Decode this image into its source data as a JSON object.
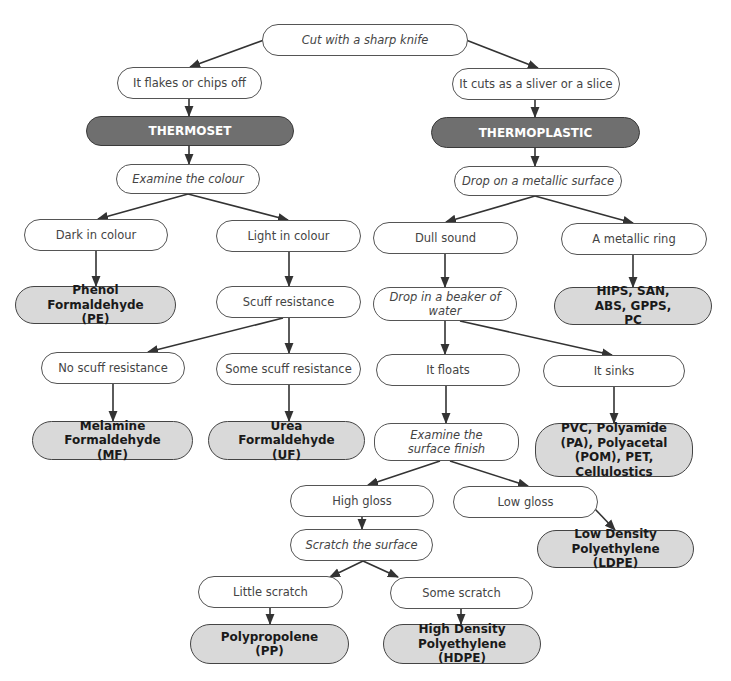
{
  "diagram": {
    "type": "decision-flowchart",
    "colors": {
      "category_fill": "#6f6f6f",
      "result_fill": "#d9d9d9",
      "node_border": "#555555",
      "edge": "#333333"
    },
    "nodes": {
      "cut": {
        "label": "Cut with a sharp knife",
        "kind": "action"
      },
      "flakes": {
        "label": "It flakes or chips off",
        "kind": "observation"
      },
      "thermoset": {
        "label": "THERMOSET",
        "kind": "category"
      },
      "examine_colour": {
        "label": "Examine the colour",
        "kind": "action"
      },
      "dark": {
        "label": "Dark in colour",
        "kind": "observation"
      },
      "light": {
        "label": "Light in colour",
        "kind": "observation"
      },
      "pe": {
        "label": "Phenol Formaldehyde (PE)",
        "kind": "result"
      },
      "scuff": {
        "label": "Scuff resistance",
        "kind": "observation"
      },
      "no_scuff": {
        "label": "No scuff resistance",
        "kind": "observation"
      },
      "some_scuff": {
        "label": "Some scuff resistance",
        "kind": "observation"
      },
      "mf": {
        "label": "Melamine Formaldehyde (MF)",
        "kind": "result"
      },
      "uf": {
        "label": "Urea Formaldehyde (UF)",
        "kind": "result"
      },
      "sliver": {
        "label": "It cuts as a sliver or a slice",
        "kind": "observation"
      },
      "thermoplastic": {
        "label": "THERMOPLASTIC",
        "kind": "category"
      },
      "drop_metal": {
        "label": "Drop on a metallic surface",
        "kind": "action"
      },
      "dull": {
        "label": "Dull sound",
        "kind": "observation"
      },
      "ring": {
        "label": "A metallic ring",
        "kind": "observation"
      },
      "hips": {
        "label": "HIPS, SAN, ABS, GPPS, PC",
        "kind": "result"
      },
      "drop_water": {
        "label": "Drop in a beaker of water",
        "kind": "action"
      },
      "floats": {
        "label": "It floats",
        "kind": "observation"
      },
      "sinks": {
        "label": "It sinks",
        "kind": "observation"
      },
      "pvc": {
        "label": "PVC, Polyamide (PA), Polyacetal (POM), PET, Cellulostics",
        "kind": "result"
      },
      "examine_surface": {
        "label": "Examine the surface finish",
        "kind": "action"
      },
      "high_gloss": {
        "label": "High gloss",
        "kind": "observation"
      },
      "low_gloss": {
        "label": "Low gloss",
        "kind": "observation"
      },
      "ldpe": {
        "label": "Low Density Polyethylene (LDPE)",
        "kind": "result"
      },
      "scratch": {
        "label": "Scratch the surface",
        "kind": "action"
      },
      "little_scratch": {
        "label": "Little scratch",
        "kind": "observation"
      },
      "some_scratch": {
        "label": "Some scratch",
        "kind": "observation"
      },
      "pp": {
        "label": "Polypropolene (PP)",
        "kind": "result"
      },
      "hdpe": {
        "label": "High Density Polyethylene (HDPE)",
        "kind": "result"
      }
    },
    "edges": [
      [
        "cut",
        "flakes"
      ],
      [
        "cut",
        "sliver"
      ],
      [
        "flakes",
        "thermoset"
      ],
      [
        "thermoset",
        "examine_colour"
      ],
      [
        "examine_colour",
        "dark"
      ],
      [
        "examine_colour",
        "light"
      ],
      [
        "dark",
        "pe"
      ],
      [
        "light",
        "scuff"
      ],
      [
        "scuff",
        "no_scuff"
      ],
      [
        "scuff",
        "some_scuff"
      ],
      [
        "no_scuff",
        "mf"
      ],
      [
        "some_scuff",
        "uf"
      ],
      [
        "sliver",
        "thermoplastic"
      ],
      [
        "thermoplastic",
        "drop_metal"
      ],
      [
        "drop_metal",
        "dull"
      ],
      [
        "drop_metal",
        "ring"
      ],
      [
        "ring",
        "hips"
      ],
      [
        "dull",
        "drop_water"
      ],
      [
        "drop_water",
        "floats"
      ],
      [
        "drop_water",
        "sinks"
      ],
      [
        "sinks",
        "pvc"
      ],
      [
        "floats",
        "examine_surface"
      ],
      [
        "examine_surface",
        "high_gloss"
      ],
      [
        "examine_surface",
        "low_gloss"
      ],
      [
        "low_gloss",
        "ldpe"
      ],
      [
        "high_gloss",
        "scratch"
      ],
      [
        "scratch",
        "little_scratch"
      ],
      [
        "scratch",
        "some_scratch"
      ],
      [
        "little_scratch",
        "pp"
      ],
      [
        "some_scratch",
        "hdpe"
      ]
    ]
  }
}
